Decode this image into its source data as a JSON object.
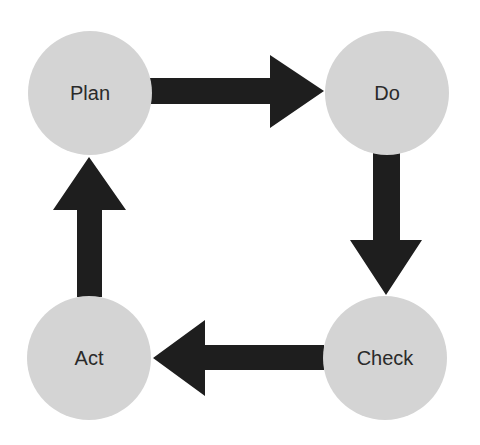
{
  "diagram": {
    "type": "cycle",
    "title": "",
    "colors": {
      "node_fill": "#d4d4d4",
      "arrow_fill": "#1e1e1e",
      "text": "#2a2a2a",
      "background": "#ffffff"
    },
    "nodes": [
      {
        "id": "plan",
        "label": "Plan"
      },
      {
        "id": "do",
        "label": "Do"
      },
      {
        "id": "check",
        "label": "Check"
      },
      {
        "id": "act",
        "label": "Act"
      }
    ],
    "edges": [
      {
        "from": "plan",
        "to": "do"
      },
      {
        "from": "do",
        "to": "check"
      },
      {
        "from": "check",
        "to": "act"
      },
      {
        "from": "act",
        "to": "plan"
      }
    ]
  }
}
